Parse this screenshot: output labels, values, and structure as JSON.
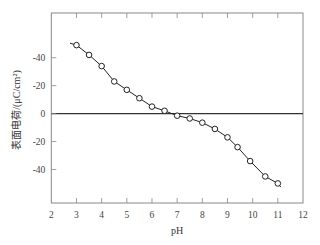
{
  "chart_data": {
    "type": "line",
    "title": "",
    "xlabel": "pH",
    "ylabel": "表面电荷/(μC/cm²)",
    "xlim": [
      2,
      12
    ],
    "ylim": [
      -64,
      72
    ],
    "grid": false,
    "legend": null,
    "x_ticks": [
      2,
      3,
      4,
      5,
      6,
      7,
      8,
      9,
      10,
      11,
      12
    ],
    "x_tick_labels": [
      "2",
      "3",
      "4",
      "5",
      "6",
      "7",
      "8",
      "9",
      "10",
      "11",
      "12"
    ],
    "y_ticks": [
      40,
      20,
      0,
      -20,
      -40
    ],
    "y_tick_labels": [
      "-40",
      "-20",
      "0",
      "-20",
      "-40"
    ],
    "zero_line": true,
    "series": [
      {
        "name": "surface charge",
        "marker": "open-circle",
        "line_start": [
          2.74,
          50.4
        ],
        "line_end": [
          11.12,
          -52.6
        ],
        "x": [
          3.0,
          3.5,
          4.0,
          4.5,
          5.0,
          5.5,
          6.0,
          6.5,
          7.0,
          7.5,
          8.0,
          8.5,
          9.0,
          9.4,
          9.9,
          10.5,
          11.0
        ],
        "values": [
          49,
          42,
          34,
          23,
          17,
          11,
          5,
          2,
          -1.5,
          -3.5,
          -6.5,
          -11,
          -17,
          -24,
          -34,
          -45,
          -50
        ]
      }
    ]
  },
  "colors": {
    "axis": "#888888",
    "line": "#222222",
    "marker_fill": "#ffffff",
    "marker_stroke": "#222222",
    "zero_line": "#333333"
  }
}
